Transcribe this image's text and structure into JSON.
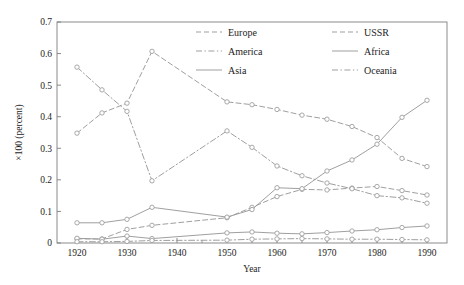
{
  "chart_data": {
    "type": "line",
    "title": "",
    "xlabel": "Year",
    "ylabel": "×100 (percent)",
    "xlim": [
      1916,
      1994
    ],
    "ylim": [
      0,
      0.7
    ],
    "yticks": [
      "0",
      "0.1",
      "0.2",
      "0.3",
      "0.4",
      "0.5",
      "0.6",
      "0.7"
    ],
    "ytick_values": [
      0,
      0.1,
      0.2,
      0.3,
      0.4,
      0.5,
      0.6,
      0.7
    ],
    "xticks": [
      "1920",
      "1930",
      "1940",
      "1950",
      "1960",
      "1970",
      "1980",
      "1990"
    ],
    "xtick_values": [
      1920,
      1930,
      1940,
      1950,
      1960,
      1970,
      1980,
      1990
    ],
    "xminor_values": [
      1925,
      1935,
      1945,
      1955,
      1965,
      1975,
      1985
    ],
    "grid": false,
    "legend_position": "top-center",
    "marker": "open-circle",
    "x": [
      1920,
      1925,
      1930,
      1935,
      1950,
      1955,
      1960,
      1965,
      1970,
      1975,
      1980,
      1985,
      1990
    ],
    "series": [
      {
        "name": "Europe",
        "style": "dashed",
        "values": [
          0.348,
          0.412,
          0.443,
          0.607,
          0.447,
          0.438,
          0.423,
          0.405,
          0.392,
          0.369,
          0.334,
          0.268,
          0.242
        ]
      },
      {
        "name": "USSR",
        "style": "dashed",
        "values": [
          0.013,
          0.013,
          0.043,
          0.056,
          0.08,
          0.113,
          0.147,
          0.17,
          0.168,
          0.174,
          0.179,
          0.166,
          0.152
        ]
      },
      {
        "name": "America",
        "style": "dash-dot",
        "values": [
          0.557,
          0.485,
          0.417,
          0.197,
          0.355,
          0.303,
          0.244,
          0.213,
          0.19,
          0.172,
          0.15,
          0.143,
          0.126
        ]
      },
      {
        "name": "Africa",
        "style": "solid",
        "values": [
          0.064,
          0.064,
          0.075,
          0.113,
          0.082,
          0.106,
          0.175,
          0.172,
          0.228,
          0.263,
          0.313,
          0.398,
          0.452
        ]
      },
      {
        "name": "Asia",
        "style": "solid",
        "values": [
          0.015,
          0.012,
          0.022,
          0.014,
          0.032,
          0.035,
          0.031,
          0.029,
          0.033,
          0.038,
          0.042,
          0.049,
          0.054
        ]
      },
      {
        "name": "Oceania",
        "style": "dash-dot",
        "values": [
          0.004,
          0.004,
          0.005,
          0.008,
          0.009,
          0.012,
          0.013,
          0.014,
          0.013,
          0.012,
          0.012,
          0.011,
          0.01
        ]
      }
    ],
    "legend_entries": [
      {
        "name": "Europe",
        "style": "dashed",
        "column": 0,
        "row": 0
      },
      {
        "name": "America",
        "style": "dash-dot",
        "column": 0,
        "row": 1
      },
      {
        "name": "Asia",
        "style": "solid",
        "column": 0,
        "row": 2
      },
      {
        "name": "USSR",
        "style": "dashed",
        "column": 1,
        "row": 0
      },
      {
        "name": "Africa",
        "style": "solid",
        "column": 1,
        "row": 1
      },
      {
        "name": "Oceania",
        "style": "dash-dot",
        "column": 1,
        "row": 2
      }
    ],
    "colors": {
      "line": "#9a9a9a",
      "marker_stroke": "#9a9a9a",
      "marker_fill": "#ffffff",
      "axis": "#7e7e7e",
      "text": "#1d1d1d",
      "background": "#ffffff"
    }
  }
}
